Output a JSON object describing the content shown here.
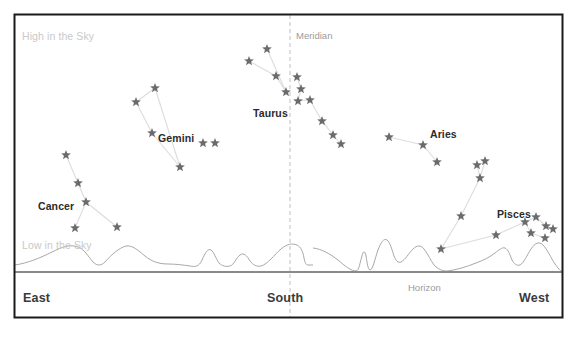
{
  "chart_data": {
    "type": "scatter",
    "xlabel": "Compass Direction",
    "ylabel": "Altitude",
    "grid": false,
    "legend_position": "none",
    "xlim": [
      0,
      577
    ],
    "ylim": [
      0,
      338
    ],
    "axis_annotations": {
      "high_in_sky": "High in the Sky",
      "low_in_sky": "Low in the Sky",
      "meridian": "Meridian",
      "horizon": "Horizon"
    },
    "direction_ticks": [
      {
        "label": "East",
        "x": 52
      },
      {
        "label": "South",
        "x": 290
      },
      {
        "label": "West",
        "x": 540
      }
    ],
    "meridian_x": 290,
    "horizon_y": 272,
    "constellations": [
      {
        "name": "Cancer",
        "label_x": 38,
        "label_y": 201,
        "stars": [
          {
            "x": 66,
            "y": 155
          },
          {
            "x": 78,
            "y": 183
          },
          {
            "x": 86,
            "y": 202
          },
          {
            "x": 75,
            "y": 228
          },
          {
            "x": 117,
            "y": 227
          }
        ],
        "lines": [
          [
            0,
            1
          ],
          [
            1,
            2
          ],
          [
            2,
            3
          ],
          [
            2,
            4
          ]
        ]
      },
      {
        "name": "Gemini",
        "label_x": 158,
        "label_y": 133,
        "stars": [
          {
            "x": 155,
            "y": 88
          },
          {
            "x": 136,
            "y": 102
          },
          {
            "x": 152,
            "y": 133
          },
          {
            "x": 180,
            "y": 167
          },
          {
            "x": 203,
            "y": 143
          },
          {
            "x": 215,
            "y": 143
          }
        ],
        "lines": [
          [
            0,
            1
          ],
          [
            1,
            2
          ],
          [
            2,
            3
          ],
          [
            0,
            3
          ]
        ]
      },
      {
        "name": "Taurus",
        "label_x": 253,
        "label_y": 108,
        "stars": [
          {
            "x": 267,
            "y": 49
          },
          {
            "x": 249,
            "y": 61
          },
          {
            "x": 276,
            "y": 76
          },
          {
            "x": 286,
            "y": 92
          },
          {
            "x": 297,
            "y": 77
          },
          {
            "x": 301,
            "y": 89
          },
          {
            "x": 298,
            "y": 101
          },
          {
            "x": 310,
            "y": 100
          },
          {
            "x": 322,
            "y": 121
          },
          {
            "x": 333,
            "y": 135
          },
          {
            "x": 341,
            "y": 144
          }
        ],
        "lines": [
          [
            0,
            3
          ],
          [
            1,
            2
          ],
          [
            2,
            3
          ],
          [
            4,
            5
          ],
          [
            5,
            6
          ],
          [
            6,
            7
          ],
          [
            7,
            8
          ],
          [
            8,
            9
          ],
          [
            9,
            10
          ]
        ]
      },
      {
        "name": "Aries",
        "label_x": 430,
        "label_y": 129,
        "stars": [
          {
            "x": 389,
            "y": 137
          },
          {
            "x": 423,
            "y": 145
          },
          {
            "x": 437,
            "y": 162
          }
        ],
        "lines": [
          [
            0,
            1
          ],
          [
            1,
            2
          ]
        ]
      },
      {
        "name": "Pisces",
        "label_x": 497,
        "label_y": 209,
        "stars": [
          {
            "x": 477,
            "y": 165
          },
          {
            "x": 485,
            "y": 161
          },
          {
            "x": 480,
            "y": 178
          },
          {
            "x": 461,
            "y": 216
          },
          {
            "x": 441,
            "y": 249
          },
          {
            "x": 496,
            "y": 235
          },
          {
            "x": 525,
            "y": 222
          },
          {
            "x": 536,
            "y": 217
          },
          {
            "x": 546,
            "y": 226
          },
          {
            "x": 531,
            "y": 233
          },
          {
            "x": 545,
            "y": 238
          },
          {
            "x": 553,
            "y": 229
          }
        ],
        "lines": [
          [
            0,
            2
          ],
          [
            1,
            2
          ],
          [
            2,
            3
          ],
          [
            3,
            4
          ],
          [
            4,
            5
          ],
          [
            5,
            6
          ],
          [
            6,
            7
          ],
          [
            7,
            8
          ],
          [
            6,
            9
          ],
          [
            9,
            10
          ],
          [
            8,
            11
          ]
        ]
      }
    ],
    "colors": {
      "star": "#6b6b6b",
      "constellation_line": "#dcdcdc",
      "horizon_line": "#8a8a8a",
      "skyline": "#a8a8a8",
      "meridian_line": "#c0c0c0",
      "frame": "#1a1a1a",
      "background": "#ffffff",
      "faint_text": "#c9c9c9",
      "grey_text": "#9b9b9b",
      "dir_text": "#3a3a3a"
    }
  }
}
